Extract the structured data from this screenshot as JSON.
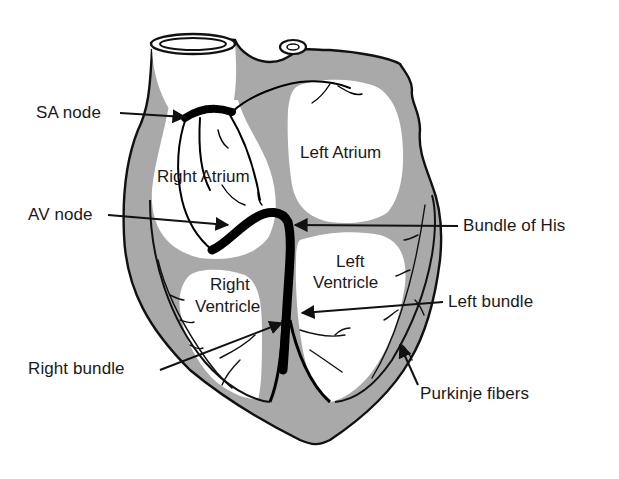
{
  "diagram": {
    "colors": {
      "outline": "#111111",
      "wall": "#a9a9a9",
      "chamber": "#ffffff",
      "conduction": "#000000",
      "background": "#ffffff"
    },
    "regions": {
      "right_atrium": "Right Atrium",
      "left_atrium": "Left Atrium",
      "right_ventricle_1": "Right",
      "right_ventricle_2": "Ventricle",
      "left_ventricle_1": "Left",
      "left_ventricle_2": "Ventricle"
    },
    "labels": {
      "sa_node": "SA node",
      "av_node": "AV node",
      "bundle_of_his": "Bundle of His",
      "left_bundle": "Left bundle",
      "right_bundle": "Right bundle",
      "purkinje_fibers": "Purkinje fibers"
    }
  }
}
